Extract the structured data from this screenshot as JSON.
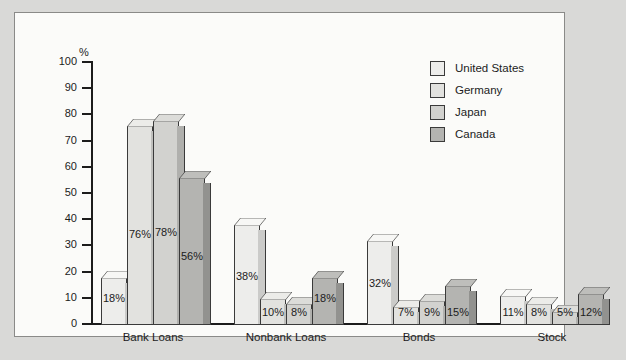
{
  "axis": {
    "unit_label": "%",
    "ticks": [
      100,
      90,
      80,
      70,
      60,
      50,
      40,
      30,
      20,
      10,
      0
    ]
  },
  "legend": {
    "items": [
      {
        "label": "United States",
        "color": "#ededeb"
      },
      {
        "label": "Germany",
        "color": "#e2e2df"
      },
      {
        "label": "Japan",
        "color": "#d2d2cf"
      },
      {
        "label": "Canada",
        "color": "#b4b4b1"
      }
    ]
  },
  "chart_data": {
    "type": "bar",
    "title": "",
    "xlabel": "",
    "ylabel": "%",
    "ylim": [
      0,
      100
    ],
    "grid": false,
    "legend_position": "top-right",
    "categories": [
      "Bank Loans",
      "Nonbank Loans",
      "Bonds",
      "Stock"
    ],
    "series": [
      {
        "name": "United States",
        "values": [
          18,
          38,
          32,
          11
        ],
        "labels": [
          "18%",
          "38%",
          "32%",
          "11%"
        ]
      },
      {
        "name": "Germany",
        "values": [
          76,
          10,
          7,
          8
        ],
        "labels": [
          "76%",
          "10%",
          "7%",
          "8%"
        ]
      },
      {
        "name": "Japan",
        "values": [
          78,
          8,
          9,
          5
        ],
        "labels": [
          "78%",
          "8%",
          "9%",
          "5%"
        ]
      },
      {
        "name": "Canada",
        "values": [
          56,
          18,
          15,
          12
        ],
        "labels": [
          "56%",
          "18%",
          "15%",
          "12%"
        ]
      }
    ]
  }
}
